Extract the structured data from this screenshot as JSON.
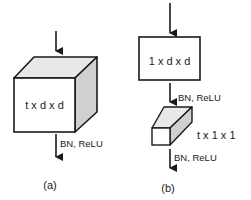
{
  "panel_a": {
    "block_label": "t x d x d",
    "activation_label": "BN, ReLU",
    "caption": "(a)"
  },
  "panel_b": {
    "spatial_block_label": "1 x d x d",
    "spatial_activation_label": "BN, ReLU",
    "temporal_block_label": "t x 1 x 1",
    "temporal_activation_label": "BN, ReLU",
    "caption": "(b)"
  },
  "colors": {
    "stroke": "#1a1a1a",
    "top_face": "#e8e8e8",
    "side_face": "#d0d0d0",
    "front_face": "#ffffff"
  }
}
